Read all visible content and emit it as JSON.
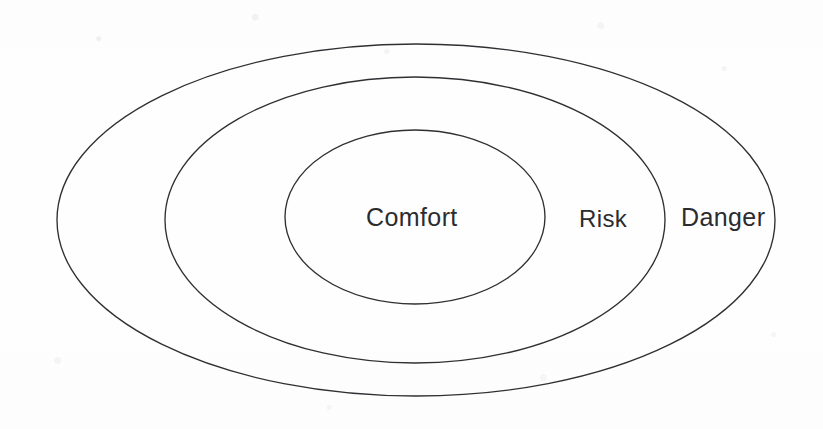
{
  "figure": {
    "background_color": "#fefefe",
    "stroke_color": "#2f3033",
    "text_color": "#2b2c2f"
  },
  "chart_data": {
    "type": "diagram",
    "diagram_kind": "concentric-ellipse-zone-model",
    "title": "",
    "grid": false,
    "legend": "none",
    "zones": [
      {
        "label": "Comfort",
        "level": 1,
        "ring": "inner",
        "cx": 415,
        "cy": 217,
        "rx": 130,
        "ry": 87,
        "label_x": 366,
        "label_y": 205,
        "font_size": 25
      },
      {
        "label": "Risk",
        "level": 2,
        "ring": "middle",
        "cx": 415,
        "cy": 220,
        "rx": 250,
        "ry": 143,
        "label_x": 579,
        "label_y": 207,
        "font_size": 24
      },
      {
        "label": "Danger",
        "level": 3,
        "ring": "outer",
        "cx": 416,
        "cy": 220,
        "rx": 359,
        "ry": 176,
        "label_x": 681,
        "label_y": 205,
        "font_size": 25
      }
    ],
    "xlabel": "",
    "ylabel": "",
    "annotations": []
  },
  "labels": {
    "comfort": "Comfort",
    "risk": "Risk",
    "danger": "Danger"
  }
}
